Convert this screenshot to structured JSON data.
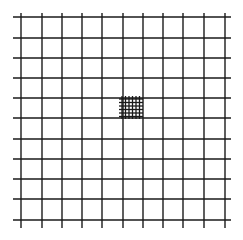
{
  "diagram": {
    "type": "grid",
    "background": "#ffffff",
    "line_color": "#1a1a1a",
    "main_grid": {
      "vertical_lines_x": [
        21,
        42,
        62,
        82,
        102,
        123,
        143,
        163,
        183,
        204,
        225
      ],
      "horizontal_lines_y": [
        17,
        38,
        58,
        78,
        98,
        118,
        139,
        159,
        179,
        199,
        220
      ],
      "h_extent": [
        13,
        231
      ],
      "v_extent": [
        13,
        228
      ],
      "stroke_width": 1.4
    },
    "dense_patch": {
      "vertical_lines_x": [
        122,
        125.5,
        129,
        132.5,
        136,
        139.5
      ],
      "horizontal_lines_y": [
        99,
        102.5,
        106,
        109.5,
        113,
        116.5
      ],
      "h_extent": [
        119,
        143
      ],
      "v_extent": [
        96,
        119
      ],
      "stroke_width": 1.3
    }
  }
}
